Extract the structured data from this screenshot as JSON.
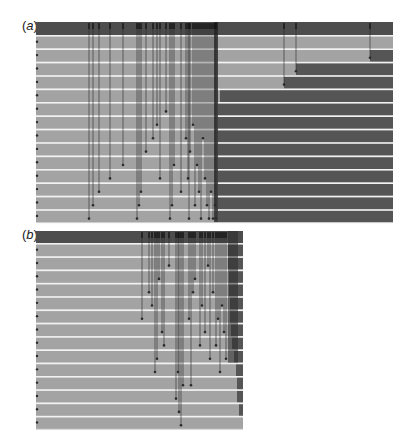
{
  "colors": {
    "light": "#a3a3a3",
    "dark": "#555555",
    "header": "#4d4d4d",
    "separator": "#f2f2f2",
    "line": "#2a2a2a",
    "background": "#ffffff"
  },
  "panels": [
    {
      "id": "a",
      "label_open": "(",
      "label_letter": "a",
      "label_close": ")",
      "label_x": 22,
      "label_y": 24,
      "x": 36,
      "y": 22,
      "width": 357,
      "header_height": 13,
      "row_height": 13.4,
      "rows": 14,
      "dark_start_per_row": [
        393,
        370,
        296,
        284,
        220,
        218,
        218,
        218,
        218,
        218,
        218,
        218,
        218,
        218
      ],
      "arrows": [
        {
          "x": 89,
          "row": 13
        },
        {
          "x": 93,
          "row": 12
        },
        {
          "x": 99,
          "row": 11
        },
        {
          "x": 110,
          "row": 10
        },
        {
          "x": 123,
          "row": 9
        },
        {
          "x": 137,
          "row": 13
        },
        {
          "x": 139,
          "row": 12
        },
        {
          "x": 141,
          "row": 11
        },
        {
          "x": 146,
          "row": 8
        },
        {
          "x": 153,
          "row": 7
        },
        {
          "x": 157,
          "row": 6
        },
        {
          "x": 160,
          "row": 10
        },
        {
          "x": 166,
          "row": 5
        },
        {
          "x": 170,
          "row": 13
        },
        {
          "x": 172,
          "row": 12
        },
        {
          "x": 174,
          "row": 9
        },
        {
          "x": 181,
          "row": 11
        },
        {
          "x": 186,
          "row": 7
        },
        {
          "x": 188,
          "row": 10
        },
        {
          "x": 189,
          "row": 13
        },
        {
          "x": 190,
          "row": 8
        },
        {
          "x": 193,
          "row": 6
        },
        {
          "x": 195,
          "row": 12
        },
        {
          "x": 197,
          "row": 9
        },
        {
          "x": 199,
          "row": 11
        },
        {
          "x": 201,
          "row": 13
        },
        {
          "x": 203,
          "row": 7
        },
        {
          "x": 205,
          "row": 10
        },
        {
          "x": 207,
          "row": 12
        },
        {
          "x": 209,
          "row": 13
        },
        {
          "x": 211,
          "row": 11
        },
        {
          "x": 213,
          "row": 13
        },
        {
          "x": 215,
          "row": 12
        },
        {
          "x": 216,
          "row": 13
        },
        {
          "x": 284,
          "row": 3
        },
        {
          "x": 296,
          "row": 2
        },
        {
          "x": 370,
          "row": 1
        }
      ],
      "ticks_left": true
    },
    {
      "id": "b",
      "label_open": "(",
      "label_letter": "b",
      "label_close": ")",
      "label_x": 22,
      "label_y": 233,
      "x": 36,
      "y": 231,
      "width": 207,
      "header_height": 12,
      "row_height": 13.3,
      "rows": 14,
      "dark_start_per_row": [
        228,
        228,
        229,
        229,
        230,
        230,
        231,
        232,
        234,
        236,
        237,
        237,
        239,
        243
      ],
      "arrows": [
        {
          "x": 142,
          "row": 5
        },
        {
          "x": 149,
          "row": 3
        },
        {
          "x": 152,
          "row": 4
        },
        {
          "x": 155,
          "row": 9
        },
        {
          "x": 157,
          "row": 8
        },
        {
          "x": 159,
          "row": 2
        },
        {
          "x": 162,
          "row": 6
        },
        {
          "x": 164,
          "row": 7
        },
        {
          "x": 169,
          "row": 1
        },
        {
          "x": 176,
          "row": 11
        },
        {
          "x": 178,
          "row": 9
        },
        {
          "x": 179,
          "row": 12
        },
        {
          "x": 181,
          "row": 13
        },
        {
          "x": 183,
          "row": 10
        },
        {
          "x": 189,
          "row": 5
        },
        {
          "x": 191,
          "row": 10
        },
        {
          "x": 193,
          "row": 3
        },
        {
          "x": 195,
          "row": 2
        },
        {
          "x": 200,
          "row": 7
        },
        {
          "x": 202,
          "row": 4
        },
        {
          "x": 205,
          "row": 6
        },
        {
          "x": 208,
          "row": 1
        },
        {
          "x": 210,
          "row": 8
        },
        {
          "x": 213,
          "row": 3
        },
        {
          "x": 216,
          "row": 7
        },
        {
          "x": 218,
          "row": 5
        },
        {
          "x": 220,
          "row": 9
        },
        {
          "x": 222,
          "row": 4
        },
        {
          "x": 224,
          "row": 6
        },
        {
          "x": 226,
          "row": 8
        }
      ],
      "ticks_left": true
    }
  ]
}
